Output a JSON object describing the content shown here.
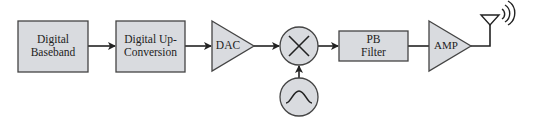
{
  "diagram": {
    "type": "block-diagram",
    "colors": {
      "block_fill": "#d9dbdf",
      "stroke": "#333333",
      "background": "#ffffff"
    },
    "blocks": [
      {
        "id": "digital-baseband",
        "shape": "rect",
        "label_line1": "Digital",
        "label_line2": "Baseband"
      },
      {
        "id": "digital-up-conversion",
        "shape": "rect",
        "label_line1": "Digital Up-",
        "label_line2": "Conversion"
      },
      {
        "id": "dac",
        "shape": "triangle",
        "label": "DAC"
      },
      {
        "id": "mixer",
        "shape": "circle",
        "symbol": "multiply-x"
      },
      {
        "id": "oscillator",
        "shape": "circle",
        "symbol": "sine-wave"
      },
      {
        "id": "pb-filter",
        "shape": "rect",
        "label_line1": "PB",
        "label_line2": "Filter"
      },
      {
        "id": "amp",
        "shape": "triangle",
        "label": "AMP"
      },
      {
        "id": "antenna",
        "shape": "antenna",
        "symbol": "radiating-waves"
      }
    ],
    "edges": [
      {
        "from": "digital-baseband",
        "to": "digital-up-conversion",
        "arrow": true
      },
      {
        "from": "digital-up-conversion",
        "to": "dac",
        "arrow": true
      },
      {
        "from": "dac",
        "to": "mixer",
        "arrow": true
      },
      {
        "from": "oscillator",
        "to": "mixer",
        "arrow": true
      },
      {
        "from": "mixer",
        "to": "pb-filter",
        "arrow": true
      },
      {
        "from": "pb-filter",
        "to": "amp",
        "arrow": false
      },
      {
        "from": "amp",
        "to": "antenna",
        "arrow": false
      }
    ]
  }
}
